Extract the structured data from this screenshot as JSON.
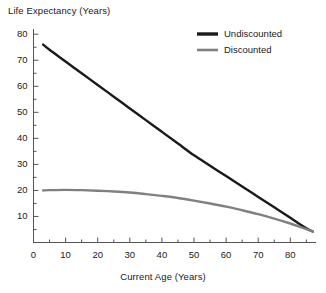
{
  "chart_data": {
    "type": "line",
    "title": "",
    "xlabel": "Current Age (Years)",
    "ylabel": "Life Expectancy (Years)",
    "xlim": [
      0,
      88
    ],
    "ylim": [
      0,
      82
    ],
    "xticks": [
      0,
      10,
      20,
      30,
      40,
      50,
      60,
      70,
      80
    ],
    "yticks": [
      10,
      20,
      30,
      40,
      50,
      60,
      70,
      80
    ],
    "xtick_labels": [
      "0",
      "10",
      "20",
      "30",
      "40",
      "50",
      "60",
      "70",
      "80"
    ],
    "ytick_labels": [
      "10",
      "20",
      "30",
      "40",
      "50",
      "60",
      "70",
      "80"
    ],
    "x_minor_tick_step": 5,
    "y_minor_tick_step": 5,
    "grid": false,
    "legend_position": "top-right",
    "series": [
      {
        "name": "Undiscounted",
        "color": "#1a1a1a",
        "x": [
          3,
          5,
          10,
          15,
          20,
          25,
          30,
          35,
          40,
          45,
          50,
          55,
          60,
          65,
          70,
          75,
          80,
          83,
          85,
          87
        ],
        "values": [
          76,
          74,
          69.5,
          65,
          60.5,
          56,
          51.5,
          47,
          42.5,
          38,
          33.5,
          29.5,
          25.5,
          21.5,
          17.5,
          13.5,
          9.5,
          7,
          5.5,
          4.2
        ]
      },
      {
        "name": "Discounted",
        "color": "#808080",
        "x": [
          3,
          5,
          10,
          15,
          20,
          25,
          30,
          35,
          40,
          45,
          50,
          55,
          60,
          65,
          70,
          75,
          80,
          83,
          85,
          87
        ],
        "values": [
          20,
          20.1,
          20.2,
          20.1,
          19.9,
          19.6,
          19.2,
          18.6,
          17.9,
          17.1,
          16.1,
          15.0,
          13.8,
          12.4,
          10.9,
          9.2,
          7.3,
          6.0,
          5.1,
          4.2
        ]
      }
    ]
  },
  "legend": {
    "items": [
      {
        "label": "Undiscounted",
        "color": "#1a1a1a"
      },
      {
        "label": "Discounted",
        "color": "#808080"
      }
    ]
  },
  "axes": {
    "x_title": "Current Age (Years)",
    "y_title": "Life Expectancy (Years)"
  }
}
